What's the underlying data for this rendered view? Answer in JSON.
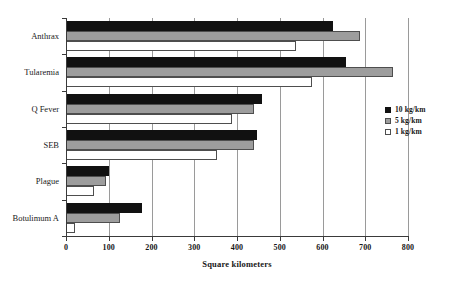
{
  "chart_data": {
    "type": "bar",
    "orientation": "horizontal",
    "title": "",
    "xlabel": "Square kilometers",
    "ylabel": "",
    "xlim": [
      0,
      800
    ],
    "xticks": [
      0,
      100,
      200,
      300,
      400,
      500,
      600,
      700,
      800
    ],
    "xtick_labels": [
      "0",
      "100",
      "200",
      "300",
      "400",
      "500",
      "600",
      "700",
      "800"
    ],
    "grid": "vertical",
    "legend_position": "right",
    "categories": [
      "Anthrax",
      "Tularemia",
      "Q Fever",
      "SEB",
      "Plague",
      "Botulimum A"
    ],
    "series": [
      {
        "name": "10 kg/km",
        "color": "#111111",
        "values": [
          624,
          655,
          458,
          447,
          100,
          178
        ]
      },
      {
        "name": "5 kg/km",
        "color": "#9d9d9d",
        "values": [
          688,
          765,
          440,
          440,
          93,
          127
        ]
      },
      {
        "name": "1 kg/km",
        "color": "#ffffff",
        "values": [
          538,
          575,
          388,
          353,
          65,
          22
        ]
      }
    ]
  },
  "legend": {
    "items": [
      {
        "label": "10 kg/km",
        "swatch": "s10"
      },
      {
        "label": "5 kg/km",
        "swatch": "s5"
      },
      {
        "label": "1 kg/km",
        "swatch": "s1"
      }
    ]
  },
  "axis": {
    "x_title": "Square kilometers"
  }
}
